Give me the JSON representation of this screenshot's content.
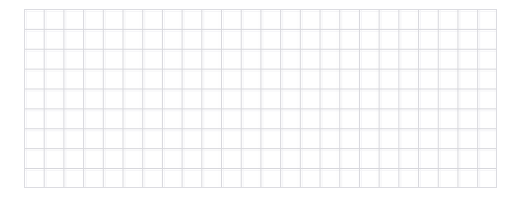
{
  "canvas": {
    "width": 521,
    "height": 199,
    "background_color": "#ffffff"
  },
  "grid": {
    "name": "empty-grid-sheet",
    "left": 24,
    "top": 9,
    "width": 473,
    "height": 179,
    "columns": 24,
    "rows": 9,
    "cell_width": 19.7,
    "cell_height": 19.9,
    "line_color_major": "#d7d7dc",
    "line_color_minor": "#ededf1",
    "border_color": "#dcdce1",
    "background_color": "#ffffff",
    "line_width": 1,
    "content": "",
    "cells": []
  }
}
